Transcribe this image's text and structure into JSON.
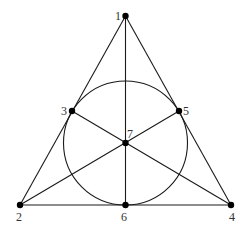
{
  "diagram": {
    "type": "fano-plane",
    "points": [
      {
        "id": "1",
        "label": "1",
        "x": 125.5,
        "y": 16,
        "lx": 115,
        "ly": 20
      },
      {
        "id": "2",
        "label": "2",
        "x": 20,
        "y": 205,
        "lx": 16,
        "ly": 221
      },
      {
        "id": "3",
        "label": "3",
        "x": 72,
        "y": 111,
        "lx": 61,
        "ly": 115
      },
      {
        "id": "4",
        "label": "4",
        "x": 231,
        "y": 205,
        "lx": 229,
        "ly": 221
      },
      {
        "id": "5",
        "label": "5",
        "x": 179,
        "y": 111,
        "lx": 183,
        "ly": 115
      },
      {
        "id": "6",
        "label": "6",
        "x": 125.5,
        "y": 205,
        "lx": 121,
        "ly": 221
      },
      {
        "id": "7",
        "label": "7",
        "x": 125.5,
        "y": 143,
        "lx": 127,
        "ly": 138
      }
    ],
    "lines": [
      [
        "1",
        "2"
      ],
      [
        "1",
        "4"
      ],
      [
        "2",
        "4"
      ],
      [
        "1",
        "6"
      ],
      [
        "2",
        "5"
      ],
      [
        "4",
        "3"
      ]
    ],
    "circle": {
      "cx": 125.5,
      "cy": 143,
      "r": 62
    }
  }
}
